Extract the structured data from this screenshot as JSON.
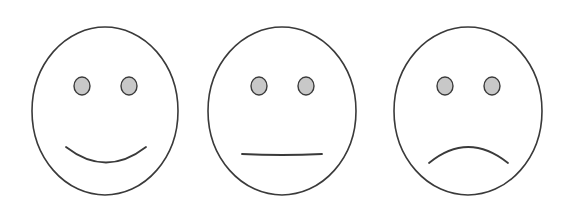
{
  "scene": {
    "description": "Three face icons arranged horizontally: happy, neutral, sad",
    "colors": {
      "background": "#ffffff",
      "outline": "#3a3a3a",
      "eye_fill": "#c8c8c8"
    },
    "faces": [
      {
        "id": "happy",
        "expression": "happy",
        "center": [
          105,
          111
        ],
        "radius": [
          73,
          84
        ],
        "eyes": [
          [
            82,
            86
          ],
          [
            129,
            86
          ]
        ],
        "mouth_path": "M66,147 Q106,178 146,147"
      },
      {
        "id": "neutral",
        "expression": "neutral",
        "center": [
          282,
          111
        ],
        "radius": [
          74,
          84
        ],
        "eyes": [
          [
            259,
            86
          ],
          [
            306,
            86
          ]
        ],
        "mouth_path": "M242,154 Q282,156 322,154"
      },
      {
        "id": "sad",
        "expression": "sad",
        "center": [
          468,
          111
        ],
        "radius": [
          74,
          84
        ],
        "eyes": [
          [
            445,
            86
          ],
          [
            492,
            86
          ]
        ],
        "mouth_path": "M429,163 Q468,131 508,163"
      }
    ]
  }
}
